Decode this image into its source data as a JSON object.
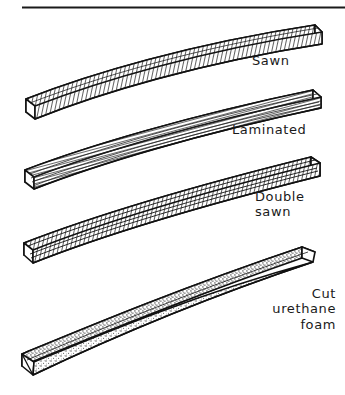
{
  "figure": {
    "background_color": "#ffffff",
    "ink_color": "#1a1a1a",
    "top_rule": {
      "name": "horizontal-rule",
      "x1": 22,
      "x2": 345,
      "y": 7
    },
    "beams": [
      {
        "id": "sawn",
        "label": "Sawn",
        "texture": "dense cross-hatch shading",
        "left_end_y": 116,
        "right_end_y": 33
      },
      {
        "id": "laminated",
        "label": "Laminated",
        "texture": "horizontal lamination strips",
        "left_end_y": 186,
        "right_end_y": 97
      },
      {
        "id": "double-sawn",
        "label": "Double\nsawn",
        "texture": "dense cross-hatch shading with laminations",
        "left_end_y": 258,
        "right_end_y": 163
      },
      {
        "id": "cut-urethane-foam",
        "label": "Cut\nurethane\nfoam",
        "texture": "stippled / speckled foam",
        "left_end_y": 370,
        "right_end_y": 250
      }
    ]
  }
}
